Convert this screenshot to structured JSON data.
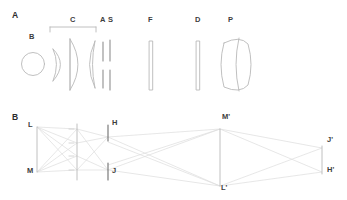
{
  "figure": {
    "background": "#ffffff",
    "line_color": "#b9b9b9",
    "ray_color": "#d8d8d8",
    "label_color": "#3d3d3d",
    "width": 347,
    "height": 200
  },
  "panel_a": {
    "label": "A",
    "caption": "Optical element layout",
    "bracket": {
      "label": "C",
      "x_start": 50,
      "x_end": 96,
      "y": 27
    },
    "elements": [
      {
        "id": "B",
        "label": "B",
        "type": "sphere",
        "description": "spherical source ball",
        "cx": 33,
        "cy": 64,
        "r": 11,
        "label_x": 29,
        "label_y": 37
      },
      {
        "id": "meniscus",
        "label": "",
        "type": "meniscus-lens",
        "description": "crescent meniscus lens",
        "x": 53,
        "y_top": 49,
        "y_bottom": 81,
        "label_x": 0,
        "label_y": 0
      },
      {
        "id": "convex1",
        "label": "",
        "type": "plano-convex-lens",
        "description": "condenser convex lens",
        "x": 76,
        "y_top": 39,
        "y_bottom": 90,
        "label_x": 0,
        "label_y": 0
      },
      {
        "id": "convex2",
        "label": "",
        "type": "concave-convex-lens",
        "description": "second condenser lens",
        "x": 92,
        "y_top": 41,
        "y_bottom": 88,
        "label_x": 0,
        "label_y": 0
      },
      {
        "id": "A",
        "label": "A",
        "type": "aperture-stop",
        "description": "aperture stop, split blades",
        "x": 103,
        "y_top": 42,
        "y_bottom": 88,
        "label_x": 100,
        "label_y": 20
      },
      {
        "id": "S",
        "label": "S",
        "type": "shutter",
        "description": "shutter, split blades",
        "x": 110,
        "y_top": 40,
        "y_bottom": 90,
        "label_x": 108,
        "label_y": 20
      },
      {
        "id": "F",
        "label": "F",
        "type": "filter-plate",
        "description": "flat filter plate",
        "x": 151,
        "y_top": 41,
        "y_bottom": 90,
        "label_x": 148,
        "label_y": 20
      },
      {
        "id": "D",
        "label": "D",
        "type": "diffuser-plate",
        "description": "flat diffuser plate",
        "x": 198,
        "y_top": 41,
        "y_bottom": 90,
        "label_x": 195,
        "label_y": 20
      },
      {
        "id": "P",
        "label": "P",
        "type": "thick-biconvex-lens",
        "description": "thick biconvex projection lens doublet",
        "x": 232,
        "y_top": 35,
        "y_bottom": 94,
        "label_x": 228,
        "label_y": 20
      }
    ]
  },
  "panel_b": {
    "label": "B",
    "caption": "Ray trace through lens array",
    "points": [
      {
        "id": "L",
        "label": "L",
        "x": 37,
        "y": 127,
        "label_x": 30,
        "label_y": 123
      },
      {
        "id": "M",
        "label": "M",
        "x": 37,
        "y": 172,
        "label_x": 29,
        "label_y": 168
      },
      {
        "id": "H",
        "label": "H",
        "x": 108,
        "y": 135,
        "label_x": 112,
        "label_y": 120
      },
      {
        "id": "J",
        "label": "J",
        "x": 108,
        "y": 172,
        "label_x": 112,
        "label_y": 167
      },
      {
        "id": "M2",
        "label": "M'",
        "x": 220,
        "y": 129,
        "label_x": 222,
        "label_y": 113
      },
      {
        "id": "L2",
        "label": "L'",
        "x": 220,
        "y": 186,
        "label_x": 221,
        "label_y": 182
      },
      {
        "id": "J2",
        "label": "J'",
        "x": 322,
        "y": 148,
        "label_x": 327,
        "label_y": 135
      },
      {
        "id": "H2",
        "label": "H'",
        "x": 322,
        "y": 172,
        "label_x": 327,
        "label_y": 165
      }
    ],
    "lens_plane": {
      "x": 77,
      "y_top": 124,
      "y_bottom": 180
    },
    "lenslet_ticks": [
      129,
      143,
      156,
      170
    ]
  }
}
